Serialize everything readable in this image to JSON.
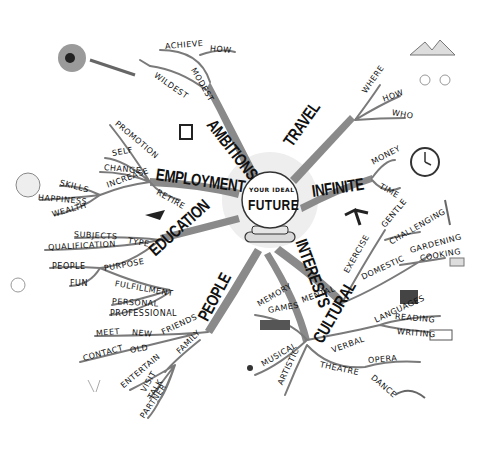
{
  "center": {
    "line1": "YOUR IDEAL",
    "line2": "FUTURE"
  },
  "branches": [
    {
      "id": "ambitions",
      "label": "AMBITIONS",
      "x": 210,
      "y": 112,
      "rot": 52,
      "children": [
        {
          "label": "ACHIEVE",
          "x": 165,
          "y": 42,
          "rot": -5
        },
        {
          "label": "HOW",
          "x": 210,
          "y": 44,
          "rot": 5
        },
        {
          "label": "WILDEST",
          "x": 155,
          "y": 70,
          "rot": 35
        },
        {
          "label": "MODEST",
          "x": 193,
          "y": 64,
          "rot": 60
        }
      ]
    },
    {
      "id": "travel",
      "label": "TRAVEL",
      "x": 288,
      "y": 135,
      "rot": -55,
      "children": [
        {
          "label": "WHERE",
          "x": 364,
          "y": 88,
          "rot": -55
        },
        {
          "label": "HOW",
          "x": 383,
          "y": 95,
          "rot": -20
        },
        {
          "label": "WHO",
          "x": 392,
          "y": 108,
          "rot": 10
        }
      ]
    },
    {
      "id": "infinite",
      "label": "INFINITE",
      "x": 312,
      "y": 182,
      "rot": -8,
      "children": [
        {
          "label": "MONEY",
          "x": 372,
          "y": 158,
          "rot": -28
        },
        {
          "label": "TIME",
          "x": 380,
          "y": 181,
          "rot": 30
        }
      ]
    },
    {
      "id": "employment",
      "label": "EMPLOYMENT",
      "x": 156,
      "y": 165,
      "rot": 8,
      "children": [
        {
          "label": "PROMOTION",
          "x": 116,
          "y": 118,
          "rot": 40
        },
        {
          "label": "SELF",
          "x": 112,
          "y": 149,
          "rot": -10
        },
        {
          "label": "CHANGE",
          "x": 104,
          "y": 163,
          "rot": 5
        },
        {
          "label": "INCREASE",
          "x": 107,
          "y": 181,
          "rot": -20
        },
        {
          "label": "RETIRE",
          "x": 157,
          "y": 187,
          "rot": 30
        },
        {
          "label": "SKILLS",
          "x": 60,
          "y": 178,
          "rot": 15
        },
        {
          "label": "HAPPINESS",
          "x": 38,
          "y": 193,
          "rot": 5
        },
        {
          "label": "WEALTH",
          "x": 52,
          "y": 210,
          "rot": -15
        }
      ]
    },
    {
      "id": "education",
      "label": "EDUCATION",
      "x": 152,
      "y": 243,
      "rot": -42,
      "children": [
        {
          "label": "SUBJECTS",
          "x": 74,
          "y": 230,
          "rot": 3
        },
        {
          "label": "TYPE",
          "x": 128,
          "y": 236,
          "rot": 10
        },
        {
          "label": "QUALIFICATION",
          "x": 48,
          "y": 243,
          "rot": -3
        },
        {
          "label": "PEOPLE",
          "x": 52,
          "y": 262,
          "rot": 0
        },
        {
          "label": "PURPOSE",
          "x": 104,
          "y": 264,
          "rot": -10
        },
        {
          "label": "FUN",
          "x": 70,
          "y": 279,
          "rot": 0
        },
        {
          "label": "FULFILLMENT",
          "x": 115,
          "y": 279,
          "rot": 10
        }
      ]
    },
    {
      "id": "people",
      "label": "PEOPLE",
      "x": 203,
      "y": 310,
      "rot": -62,
      "children": [
        {
          "label": "PERSONAL",
          "x": 112,
          "y": 297,
          "rot": 3
        },
        {
          "label": "PROFESSIONAL",
          "x": 110,
          "y": 309,
          "rot": 0
        },
        {
          "label": "MEET",
          "x": 96,
          "y": 329,
          "rot": -5
        },
        {
          "label": "NEW",
          "x": 132,
          "y": 328,
          "rot": 5
        },
        {
          "label": "FRIENDS",
          "x": 162,
          "y": 328,
          "rot": -25
        },
        {
          "label": "CONTACT",
          "x": 83,
          "y": 354,
          "rot": -15
        },
        {
          "label": "OLD",
          "x": 130,
          "y": 346,
          "rot": -10
        },
        {
          "label": "FAMILY",
          "x": 178,
          "y": 348,
          "rot": -45
        },
        {
          "label": "ENTERTAIN",
          "x": 122,
          "y": 382,
          "rot": -40
        },
        {
          "label": "VISIT",
          "x": 143,
          "y": 387,
          "rot": -60
        },
        {
          "label": "TALK",
          "x": 150,
          "y": 394,
          "rot": -60
        },
        {
          "label": "PARTNER",
          "x": 142,
          "y": 413,
          "rot": -55
        }
      ]
    },
    {
      "id": "interests",
      "label": "INTERESTS",
      "x": 300,
      "y": 230,
      "rot": 70,
      "children": [
        {
          "label": "EXERCISE",
          "x": 346,
          "y": 268,
          "rot": -60
        },
        {
          "label": "GENTLE",
          "x": 383,
          "y": 222,
          "rot": -50
        },
        {
          "label": "CHALLENGING",
          "x": 390,
          "y": 238,
          "rot": -30
        },
        {
          "label": "DOMESTIC",
          "x": 362,
          "y": 273,
          "rot": -25
        },
        {
          "label": "GARDENING",
          "x": 410,
          "y": 246,
          "rot": -15
        },
        {
          "label": "COOKING",
          "x": 420,
          "y": 254,
          "rot": -10
        }
      ]
    },
    {
      "id": "cultural",
      "label": "CULTURAL",
      "x": 318,
      "y": 332,
      "rot": -60,
      "children": [
        {
          "label": "MEMORY",
          "x": 258,
          "y": 300,
          "rot": -30
        },
        {
          "label": "GAMES",
          "x": 268,
          "y": 306,
          "rot": -10
        },
        {
          "label": "MENTAL",
          "x": 302,
          "y": 296,
          "rot": -20
        },
        {
          "label": "LANGUAGES",
          "x": 375,
          "y": 316,
          "rot": -25
        },
        {
          "label": "READING",
          "x": 395,
          "y": 312,
          "rot": 5
        },
        {
          "label": "WRITING",
          "x": 397,
          "y": 327,
          "rot": 5
        },
        {
          "label": "VERBAL",
          "x": 332,
          "y": 346,
          "rot": -20
        },
        {
          "label": "MUSICAL",
          "x": 262,
          "y": 360,
          "rot": -30
        },
        {
          "label": "ARTISTIC",
          "x": 280,
          "y": 380,
          "rot": -65
        },
        {
          "label": "THEATRE",
          "x": 320,
          "y": 360,
          "rot": 12
        },
        {
          "label": "OPERA",
          "x": 368,
          "y": 356,
          "rot": -5
        },
        {
          "label": "DANCE",
          "x": 372,
          "y": 372,
          "rot": 40
        }
      ]
    }
  ],
  "colors": {
    "branch": "#8a8a8a",
    "branch_dark": "#5c5c5c",
    "ink": "#111111",
    "glow": "#e8e8e8"
  }
}
